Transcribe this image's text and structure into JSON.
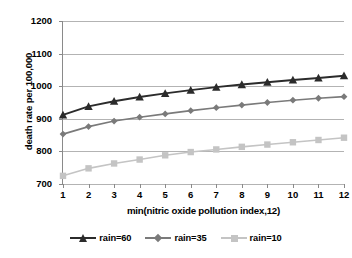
{
  "chart_data": {
    "type": "line",
    "title": "",
    "xlabel": "min(nitric oxide pollution index,12)",
    "ylabel": "death rate per 100,000",
    "x": [
      1,
      2,
      3,
      4,
      5,
      6,
      7,
      8,
      9,
      10,
      11,
      12
    ],
    "categories": [
      "1",
      "2",
      "3",
      "4",
      "5",
      "6",
      "7",
      "8",
      "9",
      "10",
      "11",
      "12"
    ],
    "xlim": [
      1,
      12
    ],
    "ylim": [
      700,
      1200
    ],
    "yticks": [
      700,
      800,
      900,
      1000,
      1100,
      1200
    ],
    "ytick_labels": [
      "700",
      "800",
      "900",
      "1000",
      "1100",
      "1200"
    ],
    "grid": "horizontal",
    "legend_position": "bottom",
    "series": [
      {
        "name": "rain=60",
        "color": "#2b2b2b",
        "marker": "triangle",
        "values": [
          912,
          938,
          954,
          967,
          978,
          988,
          997,
          1005,
          1012,
          1019,
          1025,
          1032
        ]
      },
      {
        "name": "rain=35",
        "color": "#7a7a7a",
        "marker": "diamond",
        "values": [
          853,
          876,
          893,
          905,
          915,
          925,
          934,
          942,
          950,
          957,
          963,
          968
        ]
      },
      {
        "name": "rain=10",
        "color": "#c4c4c4",
        "marker": "square",
        "values": [
          725,
          748,
          763,
          775,
          788,
          798,
          806,
          814,
          821,
          828,
          835,
          842
        ]
      }
    ]
  },
  "legend": {
    "items": [
      {
        "label": "rain=60"
      },
      {
        "label": "rain=35"
      },
      {
        "label": "rain=10"
      }
    ]
  },
  "axes": {
    "y_title": "death rate per 100,000",
    "x_title": "min(nitric oxide pollution index,12)"
  },
  "colors": {
    "gridline": "#b3b3b3",
    "axis": "#8a8a8a",
    "background": "#ffffff",
    "text": "#000000"
  }
}
